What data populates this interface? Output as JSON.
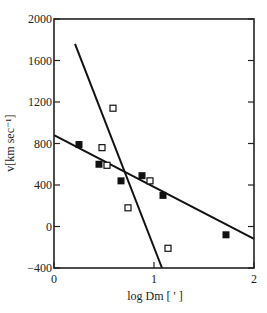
{
  "chart_data": {
    "type": "scatter",
    "title": "",
    "xlabel": "log Dm [ ' ]",
    "ylabel": "v[km sec⁻¹]",
    "xlim": [
      0,
      2
    ],
    "ylim": [
      -400,
      2000
    ],
    "x_ticks": [
      "0",
      "1",
      "2"
    ],
    "y_ticks": [
      "-400",
      "0",
      "400",
      "800",
      "1200",
      "1600",
      "2000"
    ],
    "grid": false,
    "legend": null,
    "series": [
      {
        "name": "filled squares",
        "marker": "filled-square",
        "x": [
          0.25,
          0.45,
          0.67,
          0.88,
          1.09,
          1.72
        ],
        "y": [
          790,
          600,
          440,
          490,
          300,
          -80
        ]
      },
      {
        "name": "open squares",
        "marker": "open-square",
        "x": [
          0.48,
          0.53,
          0.59,
          0.74,
          0.96,
          1.14
        ],
        "y": [
          760,
          590,
          1140,
          180,
          440,
          -210
        ]
      }
    ],
    "fit_lines": [
      {
        "name": "shallow fit",
        "x": [
          0,
          2
        ],
        "y": [
          880,
          -120
        ]
      },
      {
        "name": "steep fit",
        "x": [
          0.21,
          1.08
        ],
        "y": [
          1760,
          -400
        ]
      }
    ]
  }
}
